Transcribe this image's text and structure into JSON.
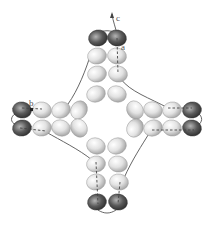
{
  "diagram": {
    "labels": [
      {
        "id": "a",
        "text": "a"
      },
      {
        "id": "b",
        "text": "b"
      },
      {
        "id": "c",
        "text": "c"
      }
    ],
    "colors": {
      "light_bead": "#e6e6e6",
      "light_bead_shade": "#a8a8a8",
      "dark_bead": "#5a5a5a",
      "dark_bead_shade": "#2a2a2a",
      "thread": "#555555"
    },
    "bead_groups": {
      "top_arm": {
        "dark_beads": 2,
        "light_beads": 6
      },
      "bottom_arm": {
        "dark_beads": 2,
        "light_beads": 6
      },
      "left_arm": {
        "dark_beads": 2,
        "light_beads": 6
      },
      "right_arm": {
        "dark_beads": 2,
        "light_beads": 6
      },
      "center_ring": {
        "light_beads": 8
      }
    }
  }
}
